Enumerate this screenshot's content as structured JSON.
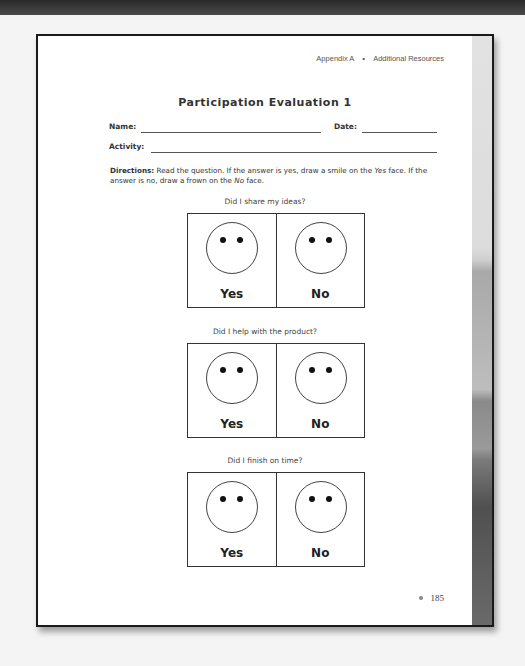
{
  "header": {
    "section": "Appendix A",
    "separator": "•",
    "subsection": "Additional Resources"
  },
  "title": "Participation Evaluation 1",
  "fields": {
    "name_label": "Name:",
    "name_value": "",
    "date_label": "Date:",
    "date_value": "",
    "activity_label": "Activity:",
    "activity_value": ""
  },
  "directions": {
    "label": "Directions:",
    "text_part1": " Read the question. If the answer is yes, draw a smile on the ",
    "yes_italic": "Yes",
    "text_part2": " face. If the answer is no, draw a frown on the ",
    "no_italic": "No",
    "text_part3": " face."
  },
  "questions": [
    {
      "text": "Did I share my ideas?",
      "yes_label": "Yes",
      "no_label": "No"
    },
    {
      "text": "Did I help with the product?",
      "yes_label": "Yes",
      "no_label": "No"
    },
    {
      "text": "Did I finish on time?",
      "yes_label": "Yes",
      "no_label": "No"
    }
  ],
  "footer": {
    "page_number": "185"
  }
}
